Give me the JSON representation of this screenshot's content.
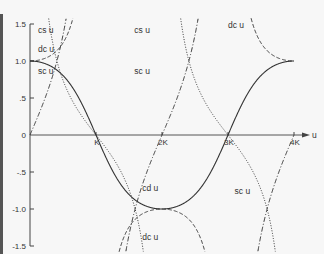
{
  "chart_data": {
    "type": "line",
    "title": "",
    "xlabel": "u",
    "ylabel": "",
    "modulus_m": 0.7,
    "x_ticks": [
      {
        "label": "K",
        "value": 1
      },
      {
        "label": "2K",
        "value": 2
      },
      {
        "label": "3K",
        "value": 3
      },
      {
        "label": "4K",
        "value": 4
      }
    ],
    "y_ticks": [
      {
        "label": "1.5",
        "value": 1.5
      },
      {
        "label": "1.0",
        "value": 1.0
      },
      {
        "label": ".5",
        "value": 0.5
      },
      {
        "label": "0",
        "value": 0
      },
      {
        "label": "-.5",
        "value": -0.5
      },
      {
        "label": "-1.0",
        "value": -1.0
      },
      {
        "label": "-1.5",
        "value": -1.5
      }
    ],
    "xlim": [
      0,
      4.3
    ],
    "ylim": [
      -1.5,
      1.5
    ],
    "grid": false,
    "series": [
      {
        "name": "cd u",
        "function": "cd",
        "style": "solid",
        "description": "starts at 1.0, crosses 0 at K, min -1.0 at 2K, 0 at 3K, 1.0 at 4K"
      },
      {
        "name": "sc u",
        "function": "sc",
        "style": "dashdot",
        "description": "0 at 0, diverges near K; 0 at 2K, diverges near 3K; 0 at 4K"
      },
      {
        "name": "dc u",
        "function": "dc",
        "style": "dashed",
        "description": "1.0 at 0, diverges near K; -1.0 at 2K; 1.0 at 4K"
      },
      {
        "name": "cs u",
        "function": "cs",
        "style": "dotted",
        "description": "diverges at 0 and 2K; 0 at K and 3K"
      }
    ],
    "annotations": [
      {
        "text": "cs u",
        "x": 0.12,
        "y": 1.38
      },
      {
        "text": "dc u",
        "x": 0.12,
        "y": 1.12
      },
      {
        "text": "sc u",
        "x": 0.12,
        "y": 0.82
      },
      {
        "text": "cs u",
        "x": 1.58,
        "y": 1.38
      },
      {
        "text": "sc u",
        "x": 1.58,
        "y": 0.82
      },
      {
        "text": "dc u",
        "x": 3.0,
        "y": 1.45
      },
      {
        "text": "cd u",
        "x": 1.7,
        "y": -0.75
      },
      {
        "text": "dc u",
        "x": 1.7,
        "y": -1.42
      },
      {
        "text": "sc u",
        "x": 3.1,
        "y": -0.8
      }
    ]
  }
}
